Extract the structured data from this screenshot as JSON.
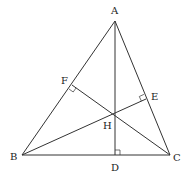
{
  "diagram": {
    "type": "triangle-orthocenter",
    "colors": {
      "stroke": "#333333",
      "text": "#222222",
      "background": "#ffffff"
    },
    "points": {
      "A": {
        "label": "A",
        "x": 115,
        "y": 21
      },
      "B": {
        "label": "B",
        "x": 22,
        "y": 155
      },
      "C": {
        "label": "C",
        "x": 170,
        "y": 155
      },
      "D": {
        "label": "D",
        "x": 115,
        "y": 155
      },
      "E": {
        "label": "E",
        "x": 146,
        "y": 99
      },
      "F": {
        "label": "F",
        "x": 72,
        "y": 85
      },
      "H": {
        "label": "H",
        "x": 115,
        "y": 114
      }
    },
    "labels": {
      "A": "A",
      "B": "B",
      "C": "C",
      "D": "D",
      "E": "E",
      "F": "F",
      "H": "H"
    },
    "segments": [
      [
        "A",
        "B"
      ],
      [
        "B",
        "C"
      ],
      [
        "C",
        "A"
      ],
      [
        "A",
        "D"
      ],
      [
        "B",
        "E"
      ],
      [
        "C",
        "F"
      ]
    ],
    "right_angles": [
      "D",
      "E",
      "F"
    ]
  }
}
